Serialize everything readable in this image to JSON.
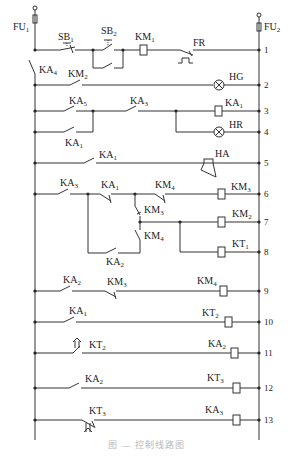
{
  "diagram": {
    "type": "electrical-ladder-control-circuit",
    "rails": {
      "left": {
        "fuse": "FU",
        "fuse_sub": "1"
      },
      "right": {
        "fuse": "FU",
        "fuse_sub": "2"
      }
    },
    "rungs": [
      {
        "n": "1",
        "elements": [
          {
            "kind": "nc-pushbutton",
            "label": "SB",
            "sub": "1"
          },
          {
            "kind": "no-pushbutton",
            "label": "SB",
            "sub": "2"
          },
          {
            "kind": "no-contact-parallel",
            "label": "",
            "sub": ""
          },
          {
            "kind": "coil",
            "label": "KM",
            "sub": "1"
          },
          {
            "kind": "thermal-nc",
            "label": "FR",
            "sub": ""
          }
        ]
      },
      {
        "n": "2",
        "elements": [
          {
            "kind": "no-contact",
            "label": "KA",
            "sub": "4",
            "note": "series on left rail"
          },
          {
            "kind": "no-contact",
            "label": "KM",
            "sub": "2"
          },
          {
            "kind": "lamp",
            "label": "HG",
            "sub": ""
          }
        ]
      },
      {
        "n": "3",
        "elements": [
          {
            "kind": "no-contact",
            "label": "KA",
            "sub": "5"
          },
          {
            "kind": "no-contact",
            "label": "KA",
            "sub": "3"
          },
          {
            "kind": "coil",
            "label": "KA",
            "sub": "1"
          }
        ]
      },
      {
        "n": "4",
        "elements": [
          {
            "kind": "no-contact",
            "label": "KA",
            "sub": "1",
            "note": "parallel to KA5"
          },
          {
            "kind": "lamp",
            "label": "HR",
            "sub": ""
          }
        ]
      },
      {
        "n": "5",
        "elements": [
          {
            "kind": "no-contact",
            "label": "KA",
            "sub": "1"
          },
          {
            "kind": "horn",
            "label": "HA",
            "sub": ""
          }
        ]
      },
      {
        "n": "6",
        "elements": [
          {
            "kind": "no-contact",
            "label": "KA",
            "sub": "3"
          },
          {
            "kind": "nc-contact",
            "label": "KA",
            "sub": "1"
          },
          {
            "kind": "nc-contact",
            "label": "KM",
            "sub": "4"
          },
          {
            "kind": "coil",
            "label": "KM",
            "sub": "3"
          }
        ]
      },
      {
        "n": "7",
        "elements": [
          {
            "kind": "nc-contact",
            "label": "KM",
            "sub": "3"
          },
          {
            "kind": "coil",
            "label": "KM",
            "sub": "2"
          }
        ]
      },
      {
        "n": "8",
        "elements": [
          {
            "kind": "no-contact",
            "label": "KM",
            "sub": "4"
          },
          {
            "kind": "no-contact",
            "label": "KA",
            "sub": "2"
          },
          {
            "kind": "coil",
            "label": "KT",
            "sub": "1"
          }
        ]
      },
      {
        "n": "9",
        "elements": [
          {
            "kind": "no-contact",
            "label": "KA",
            "sub": "2"
          },
          {
            "kind": "nc-contact",
            "label": "KM",
            "sub": "3"
          },
          {
            "kind": "coil",
            "label": "KM",
            "sub": "4"
          }
        ]
      },
      {
        "n": "10",
        "elements": [
          {
            "kind": "no-contact",
            "label": "KA",
            "sub": "1"
          },
          {
            "kind": "coil",
            "label": "KT",
            "sub": "2"
          }
        ]
      },
      {
        "n": "11",
        "elements": [
          {
            "kind": "timed-no-contact",
            "label": "KT",
            "sub": "2"
          },
          {
            "kind": "coil",
            "label": "KA",
            "sub": "2"
          }
        ]
      },
      {
        "n": "12",
        "elements": [
          {
            "kind": "no-contact",
            "label": "KA",
            "sub": "2"
          },
          {
            "kind": "coil",
            "label": "KT",
            "sub": "3"
          }
        ]
      },
      {
        "n": "13",
        "elements": [
          {
            "kind": "timed-nc-contact",
            "label": "KT",
            "sub": "3"
          },
          {
            "kind": "coil",
            "label": "KA",
            "sub": "3"
          }
        ]
      }
    ],
    "labels": {
      "fu1": "FU",
      "fu1s": "1",
      "fu2": "FU",
      "fu2s": "2",
      "sb1": "SB",
      "sb1s": "1",
      "sb2": "SB",
      "sb2s": "2",
      "km1": "KM",
      "km1s": "1",
      "fr": "FR",
      "ka4": "KA",
      "ka4s": "4",
      "km2c": "KM",
      "km2cs": "2",
      "hg": "HG",
      "ka5": "KA",
      "ka5s": "5",
      "ka3a": "KA",
      "ka3as": "3",
      "ka1coil": "KA",
      "ka1coils": "1",
      "ka1b": "KA",
      "ka1bs": "1",
      "hr": "HR",
      "ka1c": "KA",
      "ka1cs": "1",
      "ha": "HA",
      "ka3b": "KA",
      "ka3bs": "3",
      "ka1d": "KA",
      "ka1ds": "1",
      "km4a": "KM",
      "km4as": "4",
      "km3coil": "KM",
      "km3coils": "3",
      "km3c": "KM",
      "km3cs": "3",
      "km2coil": "KM",
      "km2coils": "2",
      "km4b": "KM",
      "km4bs": "4",
      "ka2a": "KA",
      "ka2as": "2",
      "kt1coil": "KT",
      "kt1coils": "1",
      "ka2b": "KA",
      "ka2bs": "2",
      "km3d": "KM",
      "km3ds": "3",
      "km4coil": "KM",
      "km4coils": "4",
      "ka1e": "KA",
      "ka1es": "1",
      "kt2coil": "KT",
      "kt2coils": "2",
      "kt2c": "KT",
      "kt2cs": "2",
      "ka2coil": "KA",
      "ka2coils": "2",
      "ka2c": "KA",
      "ka2cs": "2",
      "kt3coil": "KT",
      "kt3coils": "3",
      "kt3c": "KT",
      "kt3cs": "3",
      "ka3coil": "KA",
      "ka3coils": "3"
    },
    "rung_numbers": [
      "1",
      "2",
      "3",
      "4",
      "5",
      "6",
      "7",
      "8",
      "9",
      "10",
      "11",
      "12",
      "13"
    ],
    "caption": "图 — 控制线路图"
  }
}
